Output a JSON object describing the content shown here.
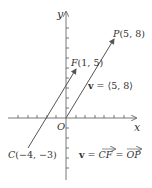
{
  "diagram": {
    "axes": {
      "x_label": "x",
      "y_label": "y",
      "origin_label": "O"
    },
    "points": {
      "P": {
        "name": "P",
        "coords": "(5, 8)",
        "x": 5,
        "y": 8
      },
      "F": {
        "name": "F",
        "coords": "(1, 5)",
        "x": 1,
        "y": 5
      },
      "C": {
        "name": "C",
        "coords": "(−4, −3)",
        "x": -4,
        "y": -3
      }
    },
    "labels": {
      "v_component": "v = ⟨5, 8⟩",
      "v_bold": "v",
      "v_comp_rest": " = ⟨5, 8⟩",
      "v_equality_bold": "v",
      "v_eq1": " = ",
      "cf": "CF",
      "v_eq2": " = ",
      "op": "OP"
    },
    "colors": {
      "axis": "#555555",
      "vector": "#555555",
      "text": "#333333"
    }
  }
}
